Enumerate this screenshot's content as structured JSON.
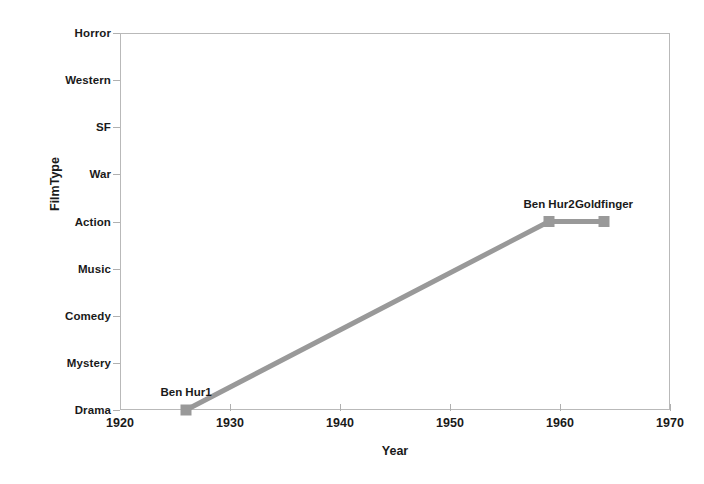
{
  "chart_data": {
    "type": "line",
    "title": "",
    "xlabel": "Year",
    "ylabel": "FilmType",
    "xlim": [
      1920,
      1970
    ],
    "xticks": [
      "1920",
      "1930",
      "1940",
      "1950",
      "1960",
      "1970"
    ],
    "xtick_values": [
      1920,
      1930,
      1940,
      1950,
      1960,
      1970
    ],
    "yticks": [
      "Drama",
      "Mystery",
      "Comedy",
      "Music",
      "Action",
      "War",
      "SF",
      "Western",
      "Horror"
    ],
    "ycategories_bottom_to_top": [
      "Drama",
      "Mystery",
      "Comedy",
      "Music",
      "Action",
      "War",
      "SF",
      "Western",
      "Horror"
    ],
    "grid": false,
    "legend": false,
    "series": [
      {
        "name": "films",
        "marker": "square",
        "color": "#999999",
        "points": [
          {
            "label": "Ben Hur1",
            "x": 1926,
            "y": "Drama",
            "y_index": 0
          },
          {
            "label": "Ben Hur2",
            "x": 1959,
            "y": "Action",
            "y_index": 4
          },
          {
            "label": "Goldfinger",
            "x": 1964,
            "y": "Action",
            "y_index": 4
          }
        ]
      }
    ],
    "annotations": [
      {
        "text": "Ben Hur1",
        "x": 1926,
        "y": "Drama"
      },
      {
        "text": "Ben Hur2",
        "x": 1959,
        "y": "Action"
      },
      {
        "text": "Goldfinger",
        "x": 1964,
        "y": "Action"
      }
    ]
  },
  "colors": {
    "series": "#999999",
    "axis": "#b9b9b9",
    "tick": "#b0b0b0",
    "text": "#1a1a1a",
    "background": "#ffffff"
  }
}
